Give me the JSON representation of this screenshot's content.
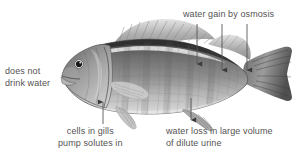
{
  "figure": {
    "background_color": "#ffffff",
    "text_color": "#555353",
    "fish_tones": {
      "dark_dorsal": "#4e4e4e",
      "mid_body": "#9a9a9a",
      "light_belly": "#d8d8d8",
      "fin_gray": "#b8b8b8",
      "outline": "#5a5a5a",
      "eye": "#1c1c1c"
    }
  },
  "annotations": {
    "osmosis": {
      "text": "water gain by osmosis",
      "arrow_count": 3,
      "arrow_direction": "down"
    },
    "no_drink": {
      "line1": "does not",
      "line2": "drink water",
      "arrow_count": 0
    },
    "gills": {
      "line1": "cells in gills",
      "line2": "pump solutes in",
      "arrow_count": 1,
      "arrow_direction": "up"
    },
    "urine_loss": {
      "line1": "water loss in large volume",
      "line2": "of dilute urine",
      "arrow_count": 1,
      "arrow_direction": "down"
    }
  }
}
